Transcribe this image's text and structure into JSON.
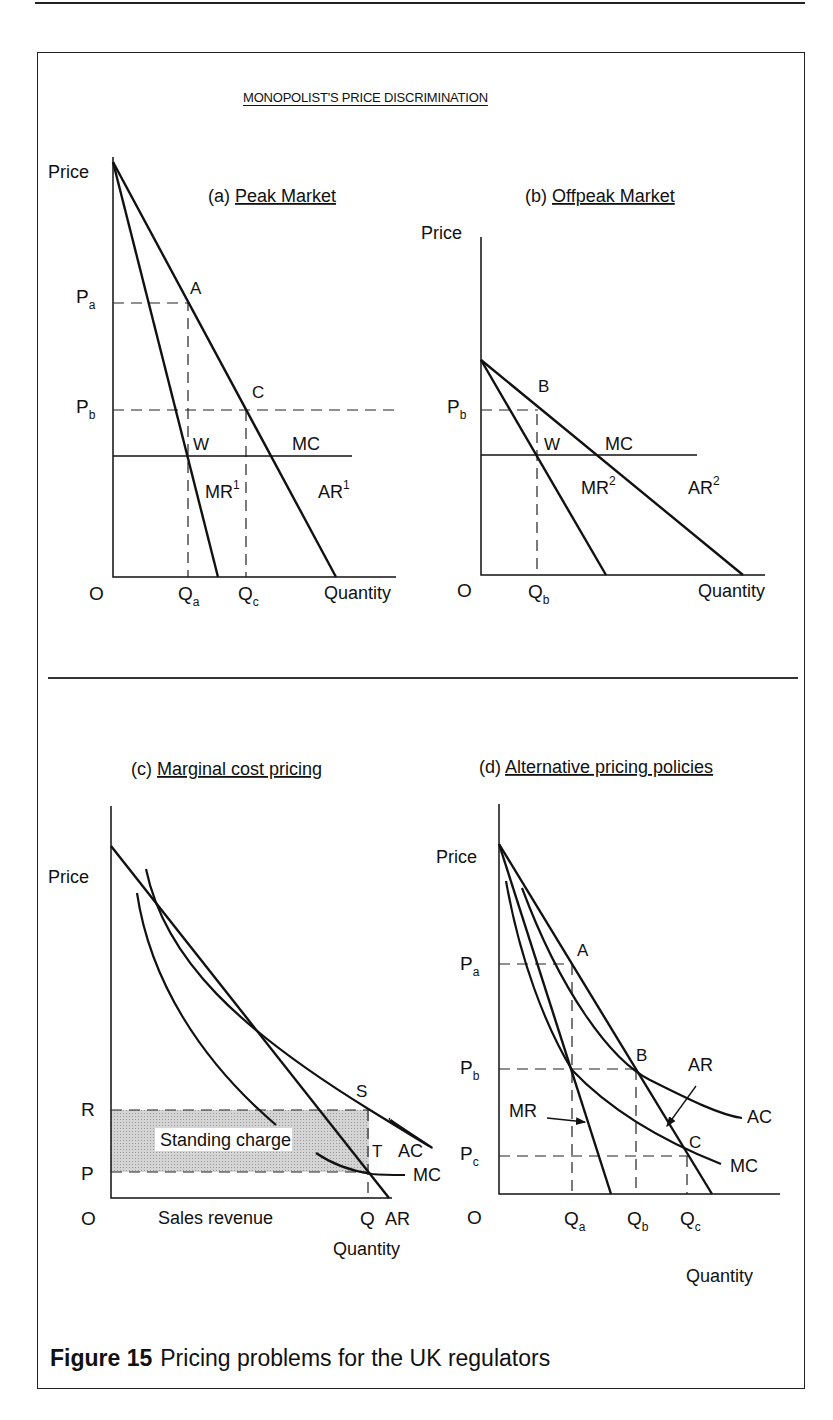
{
  "figure": {
    "main_title": "MONOPOLIST'S PRICE DISCRIMINATION",
    "caption_label": "Figure 15",
    "caption_text": "Pricing problems for the UK regulators"
  },
  "chart_data": [
    {
      "id": "a",
      "type": "line",
      "title": "(a) Peak Market",
      "panel_letter": "(a)",
      "panel_name": "Peak Market",
      "xlabel": "Quantity",
      "ylabel": "Price",
      "origin_label": "O",
      "grid": false,
      "axes": {
        "origin": [
          113,
          577
        ],
        "x_end": 396,
        "y_top": 157
      },
      "series": [
        {
          "name": "AR1",
          "label": "AR",
          "sup": "1",
          "kind": "line",
          "points": [
            [
              113,
              162
            ],
            [
              336,
              577
            ]
          ],
          "label_pos": [
            318,
            498
          ]
        },
        {
          "name": "MR1",
          "label": "MR",
          "sup": "1",
          "kind": "line",
          "points": [
            [
              113,
              162
            ],
            [
              218,
              577
            ]
          ],
          "label_pos": [
            205,
            498
          ]
        },
        {
          "name": "MC",
          "label": "MC",
          "kind": "line",
          "width": 1.3,
          "points": [
            [
              113,
              456
            ],
            [
              352,
              456
            ]
          ],
          "label_pos": [
            292,
            450
          ]
        }
      ],
      "guides": [
        {
          "points": [
            [
              113,
              303
            ],
            [
              188,
              303
            ],
            [
              188,
              577
            ]
          ]
        },
        {
          "points": [
            [
              113,
              410
            ],
            [
              395,
              410
            ]
          ]
        },
        {
          "points": [
            [
              246,
              410
            ],
            [
              246,
              577
            ]
          ]
        }
      ],
      "point_labels": [
        {
          "text": "A",
          "pos": [
            190,
            294
          ]
        },
        {
          "text": "C",
          "pos": [
            252,
            398
          ]
        },
        {
          "text": "W",
          "pos": [
            193,
            450
          ]
        }
      ],
      "tick_labels": [
        {
          "text": "P",
          "sub": "a",
          "pos": [
            76,
            303
          ],
          "axis": "y"
        },
        {
          "text": "P",
          "sub": "b",
          "pos": [
            76,
            413
          ],
          "axis": "y"
        },
        {
          "text": "Q",
          "sub": "a",
          "pos": [
            178,
            600
          ],
          "axis": "x"
        },
        {
          "text": "Q",
          "sub": "c",
          "pos": [
            238,
            600
          ],
          "axis": "x"
        }
      ],
      "label_positions": {
        "title": [
          208,
          202
        ],
        "ylabel": [
          48,
          178
        ],
        "xlabel": [
          324,
          599
        ],
        "origin": [
          89,
          600
        ]
      }
    },
    {
      "id": "b",
      "type": "line",
      "title": "(b) Offpeak Market",
      "panel_letter": "(b)",
      "panel_name": "Offpeak Market",
      "xlabel": "Quantity",
      "ylabel": "Price",
      "origin_label": "O",
      "grid": false,
      "axes": {
        "origin": [
          481,
          575
        ],
        "x_end": 765,
        "y_top": 237
      },
      "series": [
        {
          "name": "AR2",
          "label": "AR",
          "sup": "2",
          "kind": "line",
          "points": [
            [
              481,
              360
            ],
            [
              743,
              575
            ]
          ],
          "label_pos": [
            688,
            494
          ]
        },
        {
          "name": "MR2",
          "label": "MR",
          "sup": "2",
          "kind": "line",
          "points": [
            [
              481,
              360
            ],
            [
              606,
              575
            ]
          ],
          "label_pos": [
            581,
            494
          ]
        },
        {
          "name": "MC",
          "label": "MC",
          "kind": "line",
          "width": 1.3,
          "points": [
            [
              481,
              455
            ],
            [
              697,
              455
            ]
          ],
          "label_pos": [
            605,
            450
          ]
        }
      ],
      "guides": [
        {
          "points": [
            [
              481,
              410
            ],
            [
              538,
              410
            ]
          ]
        },
        {
          "points": [
            [
              537,
              414
            ],
            [
              537,
              575
            ]
          ]
        }
      ],
      "point_labels": [
        {
          "text": "B",
          "pos": [
            538,
            392
          ]
        },
        {
          "text": "W",
          "pos": [
            544,
            450
          ]
        }
      ],
      "tick_labels": [
        {
          "text": "P",
          "sub": "b",
          "pos": [
            447,
            413
          ],
          "axis": "y"
        },
        {
          "text": "Q",
          "sub": "b",
          "pos": [
            528,
            598
          ],
          "axis": "x"
        }
      ],
      "label_positions": {
        "title": [
          525,
          202
        ],
        "ylabel": [
          421,
          239
        ],
        "xlabel": [
          698,
          597
        ],
        "origin": [
          457,
          597
        ]
      }
    },
    {
      "id": "c",
      "type": "line",
      "title": "(c) Marginal cost pricing",
      "panel_letter": "(c)",
      "panel_name": "Marginal cost pricing",
      "xlabel": "Quantity",
      "ylabel": "Price",
      "origin_label": "O",
      "grid": false,
      "axes": {
        "origin": [
          111,
          1198
        ],
        "x_end": 392,
        "y_top": 806
      },
      "shaded_region": {
        "name": "Standing charge area",
        "x": 111,
        "y": 1110,
        "w": 258,
        "h": 62,
        "fill": "#cfcfcf"
      },
      "areas": [
        {
          "name": "Standing charge",
          "label": "Standing charge",
          "label_box": [
            155,
            1128,
            137,
            23
          ],
          "label_pos": [
            160,
            1146
          ]
        },
        {
          "name": "Sales revenue",
          "label": "Sales revenue",
          "label_pos": [
            158,
            1224
          ]
        }
      ],
      "series": [
        {
          "name": "AR",
          "label": "AR",
          "kind": "line",
          "points": [
            [
              111,
              846
            ],
            [
              389,
              1198
            ]
          ],
          "label_pos": [
            385,
            1225
          ]
        },
        {
          "name": "AC",
          "label": "AC",
          "kind": "curve",
          "path": "M146,869 C165,960 240,1030 370,1110 S383,1117 390,1119",
          "label_pos": [
            398,
            1157
          ]
        },
        {
          "name": "MC",
          "label": "MC",
          "kind": "curve",
          "path": "M137,893 C150,980 200,1060 276,1125 M316,1153 C335,1166 358,1172 372,1174 C382,1175 395,1175 405,1175",
          "label_pos": [
            413,
            1181
          ]
        },
        {
          "name": "AR_upper",
          "kind": "curve",
          "path": "M146,869 L146,869"
        }
      ],
      "guides": [
        {
          "points": [
            [
              111,
              1110
            ],
            [
              369,
              1110
            ]
          ]
        },
        {
          "points": [
            [
              111,
              1172
            ],
            [
              369,
              1172
            ]
          ]
        },
        {
          "points": [
            [
              368,
              1110
            ],
            [
              368,
              1198
            ]
          ]
        }
      ],
      "point_labels": [
        {
          "text": "S",
          "pos": [
            356,
            1097
          ]
        },
        {
          "text": "T",
          "pos": [
            372,
            1157
          ]
        }
      ],
      "tick_labels": [
        {
          "text": "R",
          "pos": [
            81,
            1116
          ],
          "axis": "y"
        },
        {
          "text": "P",
          "pos": [
            81,
            1180
          ],
          "axis": "y"
        },
        {
          "text": "Q",
          "pos": [
            360,
            1225
          ],
          "axis": "x"
        }
      ],
      "label_positions": {
        "title": [
          131,
          775
        ],
        "ylabel": [
          48,
          883
        ],
        "xlabel": [
          333,
          1255
        ],
        "origin": [
          81,
          1225
        ]
      }
    },
    {
      "id": "d",
      "type": "line",
      "title": "(d) Alternative pricing policies",
      "panel_letter": "(d)",
      "panel_name": "Alternative pricing policies",
      "xlabel": "Quantity",
      "ylabel": "Price",
      "origin_label": "O",
      "grid": false,
      "axes": {
        "origin": [
          499,
          1194
        ],
        "x_end": 780,
        "y_top": 804
      },
      "series": [
        {
          "name": "AR",
          "label": "AR",
          "kind": "line",
          "points": [
            [
              499,
              844
            ],
            [
              712,
              1194
            ]
          ],
          "label_pos": [
            688,
            1071
          ],
          "arrow": [
            [
              696,
              1086
            ],
            [
              667,
              1126
            ]
          ]
        },
        {
          "name": "MR",
          "label": "MR",
          "kind": "line",
          "points": [
            [
              499,
              844
            ],
            [
              611,
              1194
            ]
          ],
          "label_pos": [
            509,
            1117
          ],
          "arrow": [
            [
              547,
              1118
            ],
            [
              585,
              1122
            ]
          ]
        },
        {
          "name": "AC",
          "label": "AC",
          "kind": "curve",
          "path": "M522,888 C560,990 610,1060 650,1080 C690,1100 720,1115 742,1118",
          "label_pos": [
            747,
            1123
          ]
        },
        {
          "name": "MC",
          "label": "MC",
          "kind": "curve",
          "path": "M506,881 C520,960 545,1025 572,1070 C610,1110 660,1140 721,1164",
          "label_pos": [
            730,
            1172
          ]
        }
      ],
      "guides": [
        {
          "points": [
            [
              499,
              964
            ],
            [
              572,
              964
            ]
          ]
        },
        {
          "points": [
            [
              499,
              1069
            ],
            [
              637,
              1069
            ]
          ]
        },
        {
          "points": [
            [
              499,
              1156
            ],
            [
              689,
              1156
            ]
          ]
        },
        {
          "points": [
            [
              572,
              964
            ],
            [
              572,
              1194
            ]
          ]
        },
        {
          "points": [
            [
              636,
              1069
            ],
            [
              636,
              1194
            ]
          ]
        },
        {
          "points": [
            [
              687,
              1156
            ],
            [
              687,
              1194
            ]
          ]
        }
      ],
      "point_labels": [
        {
          "text": "A",
          "pos": [
            577,
            956
          ]
        },
        {
          "text": "B",
          "pos": [
            636,
            1061
          ]
        },
        {
          "text": "C",
          "pos": [
            689,
            1148
          ]
        }
      ],
      "tick_labels": [
        {
          "text": "P",
          "sub": "a",
          "pos": [
            460,
            970
          ],
          "axis": "y"
        },
        {
          "text": "P",
          "sub": "b",
          "pos": [
            460,
            1074
          ],
          "axis": "y"
        },
        {
          "text": "P",
          "sub": "c",
          "pos": [
            460,
            1160
          ],
          "axis": "y"
        },
        {
          "text": "Q",
          "sub": "a",
          "pos": [
            564,
            1225
          ],
          "axis": "x"
        },
        {
          "text": "Q",
          "sub": "b",
          "pos": [
            627,
            1225
          ],
          "axis": "x"
        },
        {
          "text": "Q",
          "sub": "c",
          "pos": [
            680,
            1225
          ],
          "axis": "x"
        }
      ],
      "label_positions": {
        "title": [
          479,
          773
        ],
        "ylabel": [
          436,
          863
        ],
        "xlabel": [
          686,
          1282
        ],
        "origin": [
          467,
          1224
        ]
      }
    }
  ]
}
